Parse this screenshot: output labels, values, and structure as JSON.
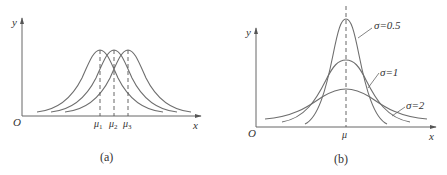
{
  "panels": [
    {
      "id": "a",
      "caption": "(a)",
      "origin_label": "O",
      "x_label": "x",
      "y_label": "y",
      "curves": [
        {
          "name": "mu1-curve",
          "mean_label": "μ1",
          "mean_base": "μ",
          "mean_sub": "1"
        },
        {
          "name": "mu2-curve",
          "mean_label": "μ2",
          "mean_base": "μ",
          "mean_sub": "2"
        },
        {
          "name": "mu3-curve",
          "mean_label": "μ3",
          "mean_base": "μ",
          "mean_sub": "3"
        }
      ],
      "description": "Three normal curves with equal variance and different means μ1 < μ2 < μ3"
    },
    {
      "id": "b",
      "caption": "(b)",
      "origin_label": "O",
      "x_label": "x",
      "y_label": "y",
      "mean_label": "μ",
      "curves": [
        {
          "name": "sigma-0.5-curve",
          "label": "σ=0.5"
        },
        {
          "name": "sigma-1-curve",
          "label": "σ=1"
        },
        {
          "name": "sigma-2-curve",
          "label": "σ=2"
        }
      ],
      "description": "Three normal curves with the same mean μ and different standard deviations"
    }
  ],
  "colors": {
    "curve": "#6e6e6e",
    "axis": "#555555",
    "text": "#333333"
  }
}
